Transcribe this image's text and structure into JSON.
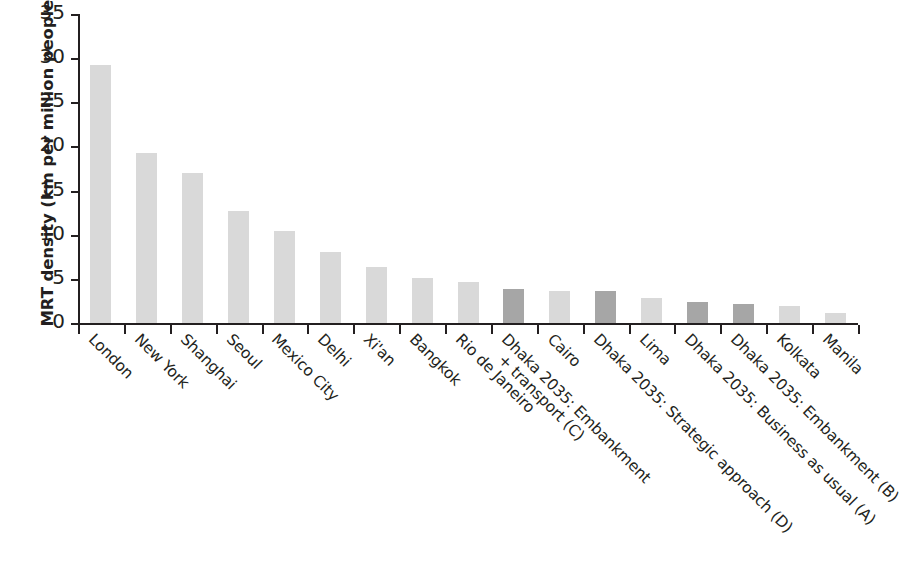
{
  "chart_data": {
    "type": "bar",
    "title": "",
    "xlabel": "",
    "ylabel": "MRT density (km per million people)",
    "ylim": [
      0,
      35
    ],
    "yticks": [
      0,
      5,
      10,
      15,
      20,
      25,
      30,
      35
    ],
    "grid": false,
    "legend": null,
    "categories": [
      "London",
      "New York",
      "Shanghai",
      "Seoul",
      "Mexico City",
      "Delhi",
      "Xi'an",
      "Bangkok",
      "Rio de Janeiro",
      "Dhaka 2035: Embankment + transport (C)",
      "Cairo",
      "Dhaka 2035: Strategic approach (D)",
      "Lima",
      "Dhaka 2035: Business as usual (A)",
      "Dhaka 2035: Embankment (B)",
      "Kolkata",
      "Manila"
    ],
    "category_lines": [
      [
        "London"
      ],
      [
        "New York"
      ],
      [
        "Shanghai"
      ],
      [
        "Seoul"
      ],
      [
        "Mexico City"
      ],
      [
        "Delhi"
      ],
      [
        "Xi'an"
      ],
      [
        "Bangkok"
      ],
      [
        "Rio de Janeiro"
      ],
      [
        "Dhaka 2035: Embankment",
        "+ transport (C)"
      ],
      [
        "Cairo"
      ],
      [
        "Dhaka 2035: Strategic approach (D)"
      ],
      [
        "Lima"
      ],
      [
        "Dhaka 2035: Business as usual (A)"
      ],
      [
        "Dhaka 2035: Embankment (B)"
      ],
      [
        "Kolkata"
      ],
      [
        "Manila"
      ]
    ],
    "values": [
      29.2,
      19.3,
      17.0,
      12.7,
      10.4,
      8.0,
      6.3,
      5.1,
      4.6,
      3.9,
      3.6,
      3.6,
      2.8,
      2.4,
      2.2,
      1.9,
      1.1
    ],
    "highlight_flags": [
      false,
      false,
      false,
      false,
      false,
      false,
      false,
      false,
      false,
      true,
      false,
      true,
      false,
      true,
      true,
      false,
      false
    ],
    "colors": {
      "bar_default": "#d9d9d9",
      "bar_highlight": "#a6a6a6",
      "axis": "#231f20",
      "text": "#231f20",
      "background": "#ffffff"
    }
  }
}
